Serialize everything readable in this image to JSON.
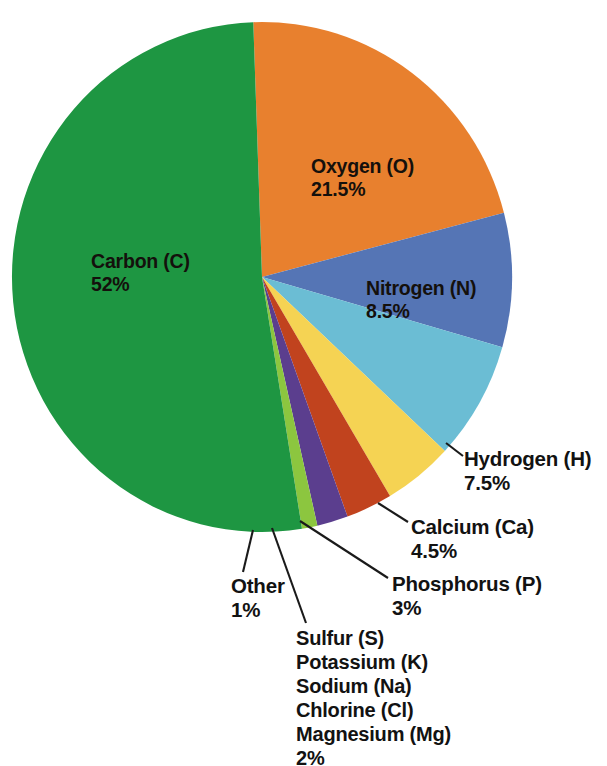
{
  "chart_data": {
    "type": "pie",
    "title": "",
    "subtitle": "",
    "xlabel": "",
    "ylabel": "",
    "legend_position": "none",
    "grid": false,
    "units": "percent",
    "start_angle_deg": -92,
    "direction": "clockwise",
    "categories": [
      "Oxygen (O)",
      "Nitrogen (N)",
      "Hydrogen (H)",
      "Calcium (Ca)",
      "Phosphorus (P)",
      "Sulfur (S) Potassium (K) Sodium (Na) Chlorine (Cl) Magnesium (Mg)",
      "Other",
      "Carbon (C)"
    ],
    "values": [
      21.5,
      8.5,
      7.5,
      4.5,
      3,
      2,
      1,
      52
    ],
    "colors": [
      "#E8802E",
      "#5575B5",
      "#6BBDD4",
      "#F5D353",
      "#C1431E",
      "#5B3E8E",
      "#8CC63F",
      "#1E9642"
    ],
    "slices": [
      {
        "name": "oxygen",
        "label": "Oxygen (O)",
        "value_label": "21.5%",
        "value": 21.5,
        "color": "#E8802E",
        "label_placement": "inside"
      },
      {
        "name": "nitrogen",
        "label": "Nitrogen (N)",
        "value_label": "8.5%",
        "value": 8.5,
        "color": "#5575B5",
        "label_placement": "inside"
      },
      {
        "name": "hydrogen",
        "label": "Hydrogen (H)",
        "value_label": "7.5%",
        "value": 7.5,
        "color": "#6BBDD4",
        "label_placement": "outside"
      },
      {
        "name": "calcium",
        "label": "Calcium (Ca)",
        "value_label": "4.5%",
        "value": 4.5,
        "color": "#F5D353",
        "label_placement": "outside"
      },
      {
        "name": "phosphorus",
        "label": "Phosphorus (P)",
        "value_label": "3%",
        "value": 3,
        "color": "#C1431E",
        "label_placement": "outside"
      },
      {
        "name": "minor-elements",
        "label": "Sulfur (S)",
        "label_lines": [
          "Sulfur (S)",
          "Potassium (K)",
          "Sodium (Na)",
          "Chlorine (Cl)",
          "Magnesium (Mg)"
        ],
        "value_label": "2%",
        "value": 2,
        "color": "#5B3E8E",
        "label_placement": "outside"
      },
      {
        "name": "other",
        "label": "Other",
        "value_label": "1%",
        "value": 1,
        "color": "#8CC63F",
        "label_placement": "outside"
      },
      {
        "name": "carbon",
        "label": "Carbon (C)",
        "value_label": "52%",
        "value": 52,
        "color": "#1E9642",
        "label_placement": "inside"
      }
    ]
  },
  "labels": {
    "carbon_name": "Carbon (C)",
    "carbon_value": "52%",
    "oxygen_name": "Oxygen (O)",
    "oxygen_value": "21.5%",
    "nitrogen_name": "Nitrogen (N)",
    "nitrogen_value": "8.5%",
    "hydrogen_name": "Hydrogen (H)",
    "hydrogen_value": "7.5%",
    "calcium_name": "Calcium (Ca)",
    "calcium_value": "4.5%",
    "phosphorus_name": "Phosphorus (P)",
    "phosphorus_value": "3%",
    "other_name": "Other",
    "other_value": "1%",
    "minor_line1": "Sulfur (S)",
    "minor_line2": "Potassium (K)",
    "minor_line3": "Sodium (Na)",
    "minor_line4": "Chlorine (Cl)",
    "minor_line5": "Magnesium (Mg)",
    "minor_value": "2%"
  },
  "geometry": {
    "center_x": 262,
    "center_y": 277,
    "radius_x": 250,
    "radius_y": 255
  }
}
